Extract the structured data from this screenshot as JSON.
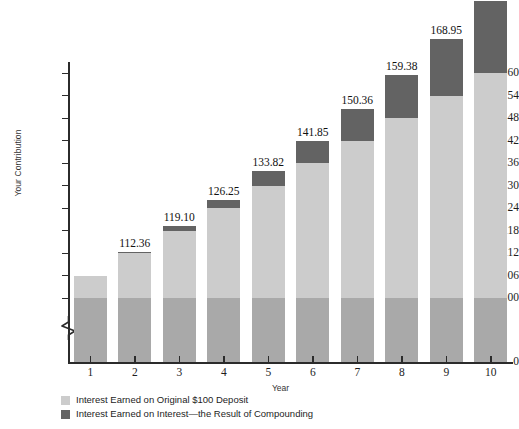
{
  "chart_data": {
    "type": "bar",
    "title": "",
    "subtitle": "",
    "xlabel": "Year",
    "ylabel": "Your Contribution",
    "categories": [
      "1",
      "2",
      "3",
      "4",
      "5",
      "6",
      "7",
      "8",
      "9",
      "10"
    ],
    "ylim": [
      100,
      160
    ],
    "y_axis_has_break": true,
    "y_zero_shown": true,
    "yticks": [
      "$160",
      "154",
      "148",
      "142",
      "136",
      "130",
      "124",
      "118",
      "112",
      "106",
      "100"
    ],
    "ytick_values": [
      160,
      154,
      148,
      142,
      136,
      130,
      124,
      118,
      112,
      106,
      100
    ],
    "ytick_zero": "0",
    "grid": false,
    "legend_position": "bottom-left",
    "stacked": true,
    "series": [
      {
        "name": "Your Contribution",
        "legend": null,
        "color": "#a9a9a9",
        "values": [
          100,
          100,
          100,
          100,
          100,
          100,
          100,
          100,
          100,
          100
        ]
      },
      {
        "name": "Interest Earned on Original $100 Deposit",
        "legend": "Interest Earned on Original $100 Deposit",
        "color": "#cccccc",
        "values": [
          6.0,
          12.0,
          18.0,
          24.0,
          30.0,
          36.0,
          42.0,
          48.0,
          54.0,
          60.0
        ]
      },
      {
        "name": "Interest Earned on Interest—the Result of Compounding",
        "legend": "Interest Earned on Interest—the Result of Compounding",
        "color": "#636363",
        "values": [
          0.0,
          0.36,
          1.1,
          2.25,
          3.82,
          5.85,
          8.36,
          11.38,
          14.95,
          19.08
        ]
      }
    ],
    "totals": [
      106.0,
      112.36,
      119.1,
      126.25,
      133.82,
      141.85,
      150.36,
      159.38,
      168.95,
      179.08
    ],
    "data_labels": [
      "",
      "112.36",
      "119.10",
      "126.25",
      "133.82",
      "141.85",
      "150.36",
      "159.38",
      "168.95",
      "179.08"
    ],
    "annotations": []
  },
  "legend": {
    "items": [
      {
        "label": "Interest Earned on Original $100 Deposit",
        "color": "#cccccc"
      },
      {
        "label": "Interest Earned on Interest—the Result of Compounding",
        "color": "#636363"
      }
    ]
  },
  "colors": {
    "principal": "#a9a9a9",
    "interest": "#cccccc",
    "compound": "#636363",
    "axis": "#2b2b2b",
    "text": "#1d1d1d",
    "background": "#ffffff"
  }
}
